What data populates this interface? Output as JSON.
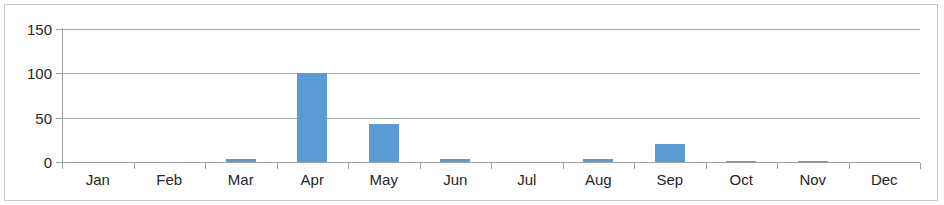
{
  "chart_data": {
    "type": "bar",
    "title": "",
    "xlabel": "",
    "ylabel": "",
    "categories": [
      "Jan",
      "Feb",
      "Mar",
      "Apr",
      "May",
      "Jun",
      "Jul",
      "Aug",
      "Sep",
      "Oct",
      "Nov",
      "Dec"
    ],
    "values": [
      0,
      0,
      3,
      100,
      43,
      3,
      0,
      3,
      20,
      1,
      1,
      0
    ],
    "series": [
      {
        "name": "",
        "values": [
          0,
          0,
          3,
          100,
          43,
          3,
          0,
          3,
          20,
          1,
          1,
          0
        ],
        "color": "#5b9bd5"
      }
    ],
    "ylim": [
      0,
      150
    ],
    "y_ticks": [
      0,
      50,
      100,
      150
    ],
    "y_tick_labels": [
      "0",
      "50",
      "100",
      "150"
    ],
    "grid": true,
    "grid_axis": "y",
    "legend": false,
    "legend_position": "none",
    "gridline_color": "#a6a6a6",
    "axis_color": "#9aa0a6",
    "border_color": "#c8ccd0",
    "background_color": "#ffffff",
    "text_color": "#262626"
  }
}
